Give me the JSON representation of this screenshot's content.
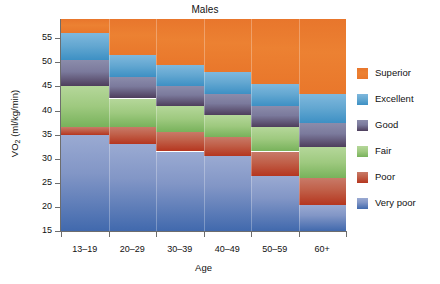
{
  "chart_data": {
    "type": "heatmap",
    "title": "Males",
    "xlabel": "Age",
    "ylabel": "VO2 (ml/kg/min)",
    "ylabel_base": "VO",
    "ylabel_sub": "2",
    "ylabel_units": " (ml/kg/min)",
    "grid": false,
    "legend_position": "right",
    "ylim": [
      15,
      59
    ],
    "yticks": [
      15,
      20,
      25,
      30,
      35,
      40,
      45,
      50,
      55
    ],
    "categories": [
      "13–19",
      "20–29",
      "30–39",
      "40–49",
      "50–59",
      "60+"
    ],
    "legend": [
      {
        "name": "Superior",
        "color": "#e8762c"
      },
      {
        "name": "Excellent",
        "color": "#5ba4cf"
      },
      {
        "name": "Good",
        "color": "#6e6a8c"
      },
      {
        "name": "Fair",
        "color": "#9ec97f"
      },
      {
        "name": "Poor",
        "color": "#bf5c45"
      },
      {
        "name": "Very poor",
        "color": "#5f7fc0"
      }
    ],
    "series": [
      {
        "name": "Superior",
        "lower": [
          56.0,
          51.5,
          49.5,
          48.0,
          45.5,
          43.5
        ],
        "upper": [
          59.0,
          59.0,
          59.0,
          59.0,
          59.0,
          59.0
        ]
      },
      {
        "name": "Excellent",
        "lower": [
          50.5,
          47.0,
          45.0,
          43.5,
          41.0,
          37.5
        ],
        "upper": [
          56.0,
          51.5,
          49.5,
          48.0,
          45.5,
          43.5
        ]
      },
      {
        "name": "Good",
        "lower": [
          45.0,
          42.5,
          41.0,
          39.0,
          36.5,
          32.5
        ],
        "upper": [
          50.5,
          47.0,
          45.0,
          43.5,
          41.0,
          37.5
        ]
      },
      {
        "name": "Fair",
        "lower": [
          36.5,
          36.5,
          35.5,
          34.5,
          31.5,
          26.0
        ],
        "upper": [
          45.0,
          42.5,
          41.0,
          39.0,
          36.5,
          32.5
        ]
      },
      {
        "name": "Poor",
        "lower": [
          35.0,
          33.0,
          31.5,
          30.5,
          26.5,
          20.5
        ],
        "upper": [
          36.5,
          36.5,
          35.5,
          34.5,
          31.5,
          26.0
        ]
      },
      {
        "name": "Very poor",
        "lower": [
          15.0,
          15.0,
          15.0,
          15.0,
          15.0,
          15.0
        ],
        "upper": [
          35.0,
          33.0,
          31.5,
          30.5,
          26.5,
          20.5
        ]
      }
    ]
  }
}
